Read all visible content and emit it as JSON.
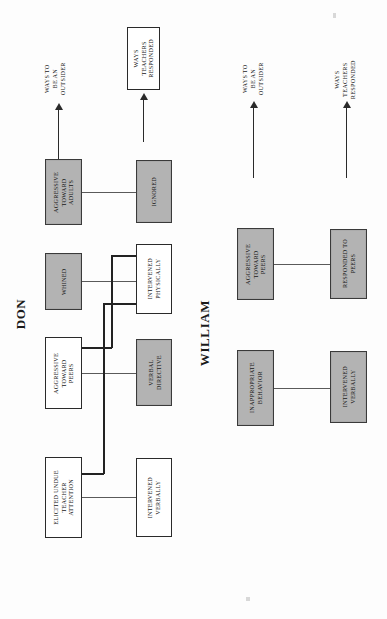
{
  "page": {
    "orientation": "rotated-90",
    "background": "#fdfdfd",
    "gray_fill": "#b3b3b3",
    "line_color": "#5a5a5a"
  },
  "persons": [
    {
      "name": "DON"
    },
    {
      "name": "WILLIAM"
    }
  ],
  "headers": {
    "don": {
      "outsider": "WAYS TO\nBE AN\nOUTSIDER",
      "outsider_lines": [
        "WAYS TO",
        "BE AN",
        "OUTSIDER"
      ],
      "teachers": "WAYS\nTEACHERS\nRESPONDED",
      "teachers_lines": [
        "WAYS",
        "TEACHERS",
        "RESPONDED"
      ],
      "teachers_boxed": true
    },
    "william": {
      "outsider_lines": [
        "WAYS TO",
        "BE AN",
        "OUTSIDER"
      ],
      "teachers_lines": [
        "WAYS",
        "TEACHERS",
        "RESPONDED"
      ],
      "teachers_boxed": false
    }
  },
  "don": {
    "outsider_nodes": [
      {
        "id": "don-aggressive-adults",
        "lines": [
          "AGGRESSIVE",
          "TOWARD",
          "ADULTS"
        ],
        "fill": "gray"
      },
      {
        "id": "don-whined",
        "lines": [
          "WHINED"
        ],
        "fill": "gray"
      },
      {
        "id": "don-aggressive-peers",
        "lines": [
          "AGGRESSIVE",
          "TOWARD",
          "PEERS"
        ],
        "fill": "white"
      },
      {
        "id": "don-elicited-attention",
        "lines": [
          "ELICITED UNDUE",
          "TEACHER",
          "ATTENTION"
        ],
        "fill": "white"
      }
    ],
    "response_nodes": [
      {
        "id": "don-ignored",
        "lines": [
          "IGNORED"
        ],
        "fill": "gray"
      },
      {
        "id": "don-intervened-physically",
        "lines": [
          "INTERVENED",
          "PHYSICALLY"
        ],
        "fill": "white"
      },
      {
        "id": "don-verbal-directive",
        "lines": [
          "VERBAL",
          "DIRECTIVE"
        ],
        "fill": "gray"
      },
      {
        "id": "don-intervened-verbally",
        "lines": [
          "INTERVENED",
          "VERBALLY"
        ],
        "fill": "white"
      }
    ],
    "links": [
      {
        "from": "don-aggressive-adults",
        "to": "don-ignored",
        "weight": "thin"
      },
      {
        "from": "don-whined",
        "to": "don-intervened-physically",
        "weight": "thin"
      },
      {
        "from": "don-aggressive-peers",
        "to": "don-verbal-directive",
        "weight": "thin"
      },
      {
        "from": "don-aggressive-peers",
        "to": "don-intervened-physically",
        "weight": "thick"
      },
      {
        "from": "don-elicited-attention",
        "to": "don-intervened-verbally",
        "weight": "thin"
      },
      {
        "from": "don-elicited-attention",
        "to": "don-intervened-physically",
        "weight": "thick"
      }
    ]
  },
  "william": {
    "outsider_nodes": [
      {
        "id": "will-aggressive-peers",
        "lines": [
          "AGGRESSIVE",
          "TOWARD",
          "PEERS"
        ],
        "fill": "gray"
      },
      {
        "id": "will-inappropriate",
        "lines": [
          "INAPPROPRIATE",
          "BEHAVIOR"
        ],
        "fill": "gray"
      }
    ],
    "response_nodes": [
      {
        "id": "will-responded-peers",
        "lines": [
          "RESPONDED TO",
          "PEERS"
        ],
        "fill": "gray"
      },
      {
        "id": "will-intervened-verbally",
        "lines": [
          "INTERVENED",
          "VERBALLY"
        ],
        "fill": "gray"
      }
    ],
    "links": [
      {
        "from": "will-aggressive-peers",
        "to": "will-responded-peers",
        "weight": "thin"
      },
      {
        "from": "will-inappropriate",
        "to": "will-intervened-verbally",
        "weight": "thin"
      }
    ]
  }
}
